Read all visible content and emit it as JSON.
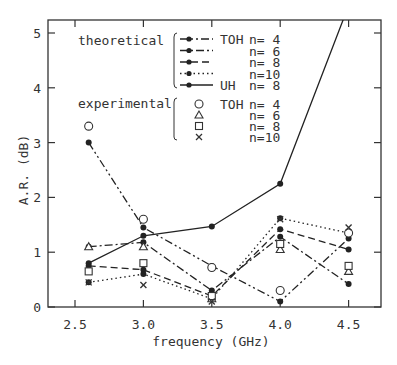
{
  "chart_data": {
    "type": "line",
    "title": "",
    "xlabel": "frequency (GHz)",
    "ylabel": "A.R. (dB)",
    "xlim": [
      2.35,
      4.7
    ],
    "ylim": [
      0,
      5.25
    ],
    "x_ticks": [
      "2.5",
      "3.0",
      "3.5",
      "4.0",
      "4.5"
    ],
    "y_ticks": [
      "0",
      "1",
      "2",
      "3",
      "4",
      "5"
    ],
    "grid": false,
    "x": [
      2.6,
      3.0,
      3.5,
      4.0,
      4.5
    ],
    "series": [
      {
        "name": "theoretical TOH n= 4",
        "group": "theoretical",
        "style": "dash-dot-dot",
        "marker": "filled-circle",
        "values": [
          3.0,
          1.45,
          0.75,
          0.1,
          1.25
        ]
      },
      {
        "name": "theoretical TOH n= 6",
        "group": "theoretical",
        "style": "dash-dot",
        "marker": "filled-circle",
        "values": [
          1.1,
          1.18,
          0.3,
          1.28,
          0.42
        ]
      },
      {
        "name": "theoretical TOH n= 8",
        "group": "theoretical",
        "style": "dashed",
        "marker": "filled-circle",
        "values": [
          0.75,
          0.68,
          0.2,
          1.42,
          1.05
        ]
      },
      {
        "name": "theoretical TOH n=10",
        "group": "theoretical",
        "style": "dotted",
        "marker": "filled-circle",
        "values": [
          0.45,
          0.6,
          0.15,
          1.62,
          1.35
        ]
      },
      {
        "name": "theoretical UH n= 8",
        "group": "theoretical",
        "style": "solid",
        "marker": "filled-circle",
        "values": [
          0.8,
          1.3,
          1.47,
          2.25,
          5.5
        ]
      },
      {
        "name": "experimental TOH n= 4",
        "group": "experimental",
        "style": "none",
        "marker": "open-circle",
        "values": [
          3.3,
          1.6,
          0.72,
          0.3,
          1.35
        ]
      },
      {
        "name": "experimental TOH n= 6",
        "group": "experimental",
        "style": "none",
        "marker": "open-triangle",
        "values": [
          1.1,
          1.1,
          0.15,
          1.05,
          0.65
        ]
      },
      {
        "name": "experimental TOH n= 8",
        "group": "experimental",
        "style": "none",
        "marker": "open-square",
        "values": [
          0.65,
          0.8,
          0.2,
          1.15,
          0.75
        ]
      },
      {
        "name": "experimental TOH n=10",
        "group": "experimental",
        "style": "none",
        "marker": "cross",
        "values": [
          0.45,
          0.4,
          0.1,
          1.6,
          1.45
        ]
      }
    ],
    "legend": {
      "position": "upper-left-inside",
      "theoretical_label": "theoretical",
      "experimental_label": "experimental",
      "theoretical_entries": [
        {
          "type": "TOH",
          "n": "n= 4"
        },
        {
          "type": "",
          "n": "n= 6"
        },
        {
          "type": "",
          "n": "n= 8"
        },
        {
          "type": "",
          "n": "n=10"
        },
        {
          "type": "UH",
          "n": "n= 8"
        }
      ],
      "experimental_entries": [
        {
          "type": "TOH",
          "n": "n= 4"
        },
        {
          "type": "",
          "n": "n= 6"
        },
        {
          "type": "",
          "n": "n= 8"
        },
        {
          "type": "",
          "n": "n=10"
        }
      ]
    }
  }
}
